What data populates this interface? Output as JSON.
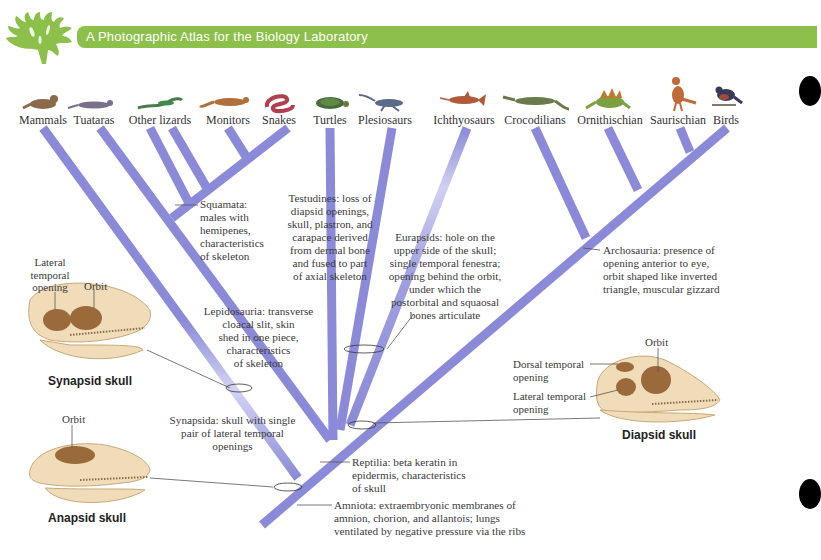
{
  "header": {
    "title": "A Photographic Atlas for the Biology Laboratory",
    "banner_color": "#8dc04a",
    "logo_icon": "coral-logo-icon"
  },
  "taxa": [
    {
      "label": "Mammals",
      "x": 43,
      "color": "#8b6a4a"
    },
    {
      "label": "Tuataras",
      "x": 94,
      "color": "#7a6f8a"
    },
    {
      "label": "Other lizards",
      "x": 160,
      "color": "#4a7a4a"
    },
    {
      "label": "Monitors",
      "x": 228,
      "color": "#b0703a"
    },
    {
      "label": "Snakes",
      "x": 279,
      "color": "#b04050"
    },
    {
      "label": "Turtles",
      "x": 330,
      "color": "#4a6a3a"
    },
    {
      "label": "Plesiosaurs",
      "x": 385,
      "color": "#5a6a8a"
    },
    {
      "label": "Ichthyosaurs",
      "x": 464,
      "color": "#b05a3a"
    },
    {
      "label": "Crocodilians",
      "x": 535,
      "color": "#6a7a4a"
    },
    {
      "label": "Ornithischian",
      "x": 610,
      "color": "#7aa040"
    },
    {
      "label": "Saurischian",
      "x": 678,
      "color": "#c06a3a"
    },
    {
      "label": "Birds",
      "x": 726,
      "color": "#3a3a5a"
    }
  ],
  "annotations": {
    "squamata": [
      "Squamata:",
      "males with",
      "hemipenes,",
      "characteristics",
      "of skeleton"
    ],
    "testudines": [
      "Testudines: loss of",
      "diapsid openings,",
      "skull, plastron, and",
      "carapace derived",
      "from dermal bone",
      "and fused to part",
      "of axial skeleton"
    ],
    "eurapsids": [
      "Eurapsids: hole on the",
      "upper side of the skull;",
      "single temporal fenestra;",
      "opening behind the orbit,",
      "under which the",
      "postorbital and squaosal",
      "bones articulate"
    ],
    "archosauria": [
      "Archosauria: presence of",
      "opening anterior to eye,",
      "orbit shaped like inverted",
      "triangle, muscular gizzard"
    ],
    "lepidosauria": [
      "Lepidosauria: transverse",
      "cloacal slit, skin",
      "shed in one piece,",
      "characteristics",
      "of skeleton"
    ],
    "synapsida": [
      "Synapsida: skull with single",
      "pair of lateral temporal",
      "openings"
    ],
    "reptilia": [
      "Reptilia: beta keratin in",
      "epidermis, characteristics",
      "of skull"
    ],
    "amniota": [
      "Amniota: extraembryonic membranes of",
      "amnion, chorion, and allantois; lungs",
      "ventilated by negative pressure via the ribs"
    ]
  },
  "skulls": {
    "synapsid": {
      "title": "Synapsid skull",
      "labels": {
        "lateral": [
          "Lateral",
          "temporal",
          "opening"
        ],
        "orbit": "Orbit"
      }
    },
    "anapsid": {
      "title": "Anapsid skull",
      "labels": {
        "orbit": "Orbit"
      }
    },
    "diapsid": {
      "title": "Diapsid skull",
      "labels": {
        "orbit": "Orbit",
        "dorsal": [
          "Dorsal temporal",
          "opening"
        ],
        "lateral": [
          "Lateral temporal",
          "opening"
        ]
      }
    }
  },
  "colors": {
    "branch": "#8a8ad8",
    "branch_light": "#c8c8f0",
    "bone": "#f0dcb8",
    "bone_dark": "#9a6a3a"
  }
}
